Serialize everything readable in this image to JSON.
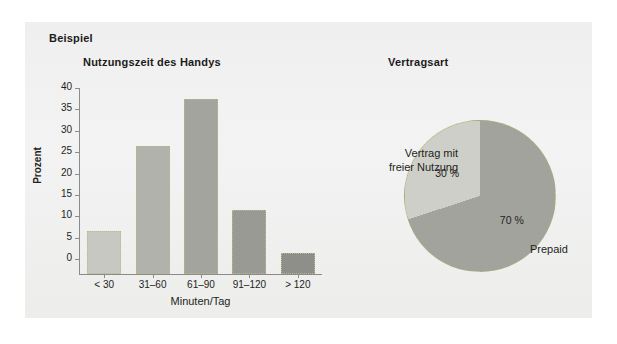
{
  "panel": {
    "example_label": "Beispiel",
    "background_color": "#f1f1f1"
  },
  "bar_chart": {
    "title": "Nutzungszeit des Handys",
    "ylabel": "Prozent",
    "xlabel": "Minuten/Tag"
  },
  "pie_chart": {
    "title": "Vertragsart",
    "label_left": "Vertrag mit",
    "label_left_2": "freier Nutzung",
    "label_right": "Prepaid",
    "pct_left": "30 %",
    "pct_right": "70 %"
  },
  "chart_data": [
    {
      "type": "bar",
      "title": "Nutzungszeit des Handys",
      "xlabel": "Minuten/Tag",
      "ylabel": "Prozent",
      "categories": [
        "< 30",
        "31–60",
        "61–90",
        "91–120",
        "> 120"
      ],
      "values": [
        10,
        30,
        41,
        15,
        5
      ],
      "ylim": [
        0,
        40
      ],
      "yticks": [
        0,
        5,
        10,
        15,
        20,
        25,
        30,
        35,
        40
      ],
      "grid": false,
      "legend": "none",
      "bar_colors": [
        "#c8c8c3",
        "#b2b2ad",
        "#a4a49f",
        "#9a9a95",
        "#8f8f8a"
      ],
      "bar_border_color": "#b8b888"
    },
    {
      "type": "pie",
      "title": "Vertragsart",
      "labels": [
        "Vertrag mit freier Nutzung",
        "Prepaid"
      ],
      "values": [
        30,
        70
      ],
      "data_labels": [
        "30 %",
        "70 %"
      ],
      "slice_colors": [
        "#cfcfca",
        "#a3a39e"
      ],
      "border_color": "#b0b060",
      "legend": "outside-labels"
    }
  ]
}
